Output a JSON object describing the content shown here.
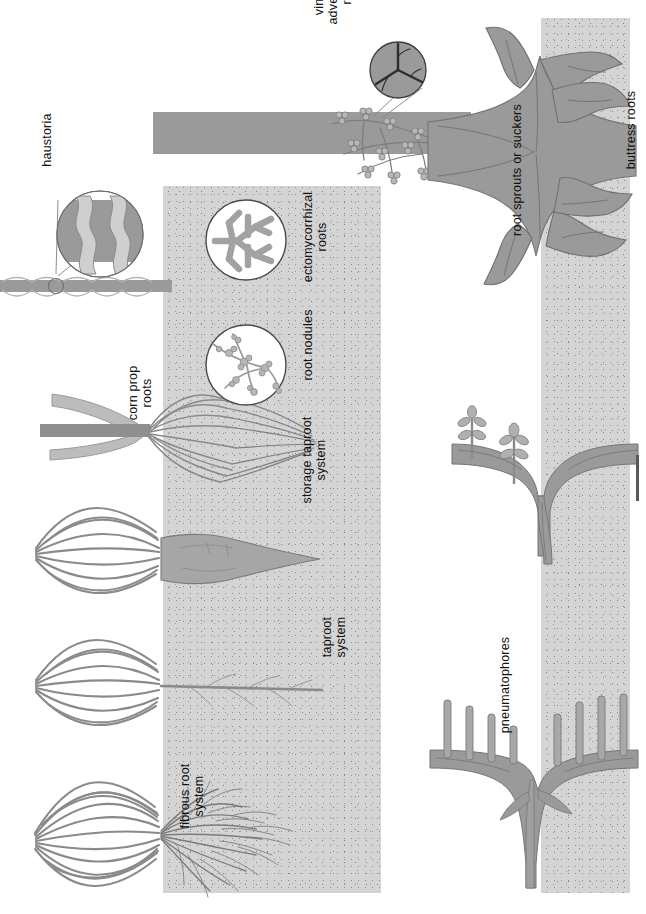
{
  "figure": {
    "orientation": "rotated-90",
    "palette": {
      "soil_fill": "#d4d4d4",
      "soil_speckle": "#7d7d7d",
      "root_fill": "#9a9a9a",
      "root_stroke": "#6d6d6d",
      "stem_fill": "#8f8f8f",
      "leaf_fill": "#b4b4b4",
      "inset_ring": "#4a4a4a",
      "label_color": "#111111",
      "page_background": "#ffffff"
    }
  },
  "labels": [
    {
      "id": "haustoria",
      "text": "haustoria"
    },
    {
      "id": "corn-prop-roots",
      "text": "corn prop\nroots"
    },
    {
      "id": "root-nodules",
      "text": "root nodules"
    },
    {
      "id": "ectomycorrhizal-roots",
      "text": "ectomycorrhizal\nroots"
    },
    {
      "id": "vine-adventitious",
      "text": "vine with\nadventitious\nroots"
    },
    {
      "id": "buttress-roots",
      "text": "buttress roots"
    },
    {
      "id": "root-sprouts",
      "text": "root sprouts or suckers"
    },
    {
      "id": "pneumatophores",
      "text": "pneumatophores"
    },
    {
      "id": "fibrous-root-system",
      "text": "fibrous root\nsystem"
    },
    {
      "id": "taproot-system",
      "text": "taproot\nsystem"
    },
    {
      "id": "storage-taproot",
      "text": "storage taproot\nsystem"
    }
  ],
  "panels": {
    "soil_left": {
      "name": "left soil block"
    },
    "soil_right": {
      "name": "right soil block"
    }
  },
  "specimens": [
    {
      "id": "fibrous-root-plant",
      "label": "fibrous root system",
      "soil": "left"
    },
    {
      "id": "taproot-plant",
      "label": "taproot system",
      "soil": "left"
    },
    {
      "id": "storage-taproot-plant",
      "label": "storage taproot system",
      "soil": "left"
    },
    {
      "id": "corn-plant",
      "label": "corn prop roots",
      "soil": "left"
    },
    {
      "id": "nodule-inset",
      "label": "root nodules",
      "soil": "left"
    },
    {
      "id": "mycorrhiza-inset",
      "label": "ectomycorrhizal roots",
      "soil": "left"
    },
    {
      "id": "parasite-stem",
      "label": "haustoria",
      "soil": "none"
    },
    {
      "id": "vine-stem",
      "label": "vine with adventitious roots",
      "soil": "none"
    },
    {
      "id": "buttress-tree",
      "label": "buttress roots",
      "soil": "right"
    },
    {
      "id": "sucker-root",
      "label": "root sprouts or suckers",
      "soil": "right"
    },
    {
      "id": "pneumatophore-root",
      "label": "pneumatophores",
      "soil": "right"
    }
  ]
}
